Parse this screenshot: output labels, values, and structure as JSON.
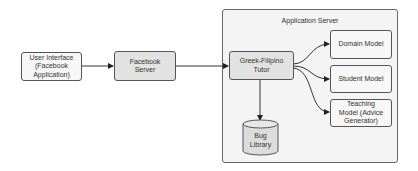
{
  "diagram": {
    "nodes": {
      "user_interface": {
        "label_line1": "User Interface",
        "label_line2": "(Facebook",
        "label_line3": "Application)"
      },
      "facebook_server": {
        "label_line1": "Facebook",
        "label_line2": "Server"
      },
      "application_server": {
        "label": "Application Server"
      },
      "tutor": {
        "label_line1": "Greek-Filipino",
        "label_line2": "Tutor"
      },
      "domain_model": {
        "label": "Domain Model"
      },
      "student_model": {
        "label": "Student Model"
      },
      "teaching_model": {
        "label_line1": "Teaching",
        "label_line2": "Model (Advice",
        "label_line3": "Generator)"
      },
      "bug_library": {
        "label_line1": "Bug",
        "label_line2": "Library"
      }
    },
    "edges": [
      {
        "from": "User Interface",
        "to": "Facebook Server"
      },
      {
        "from": "Facebook Server",
        "to": "Greek-Filipino Tutor"
      },
      {
        "from": "Greek-Filipino Tutor",
        "to": "Domain Model"
      },
      {
        "from": "Greek-Filipino Tutor",
        "to": "Student Model"
      },
      {
        "from": "Greek-Filipino Tutor",
        "to": "Teaching Model (Advice Generator)"
      },
      {
        "from": "Greek-Filipino Tutor",
        "to": "Bug Library"
      }
    ],
    "colors": {
      "node_fill_light": "#f7f7f7",
      "node_fill_dark": "#e2e2e2",
      "container_fill": "#f4f4f4",
      "stroke": "#555555"
    }
  }
}
